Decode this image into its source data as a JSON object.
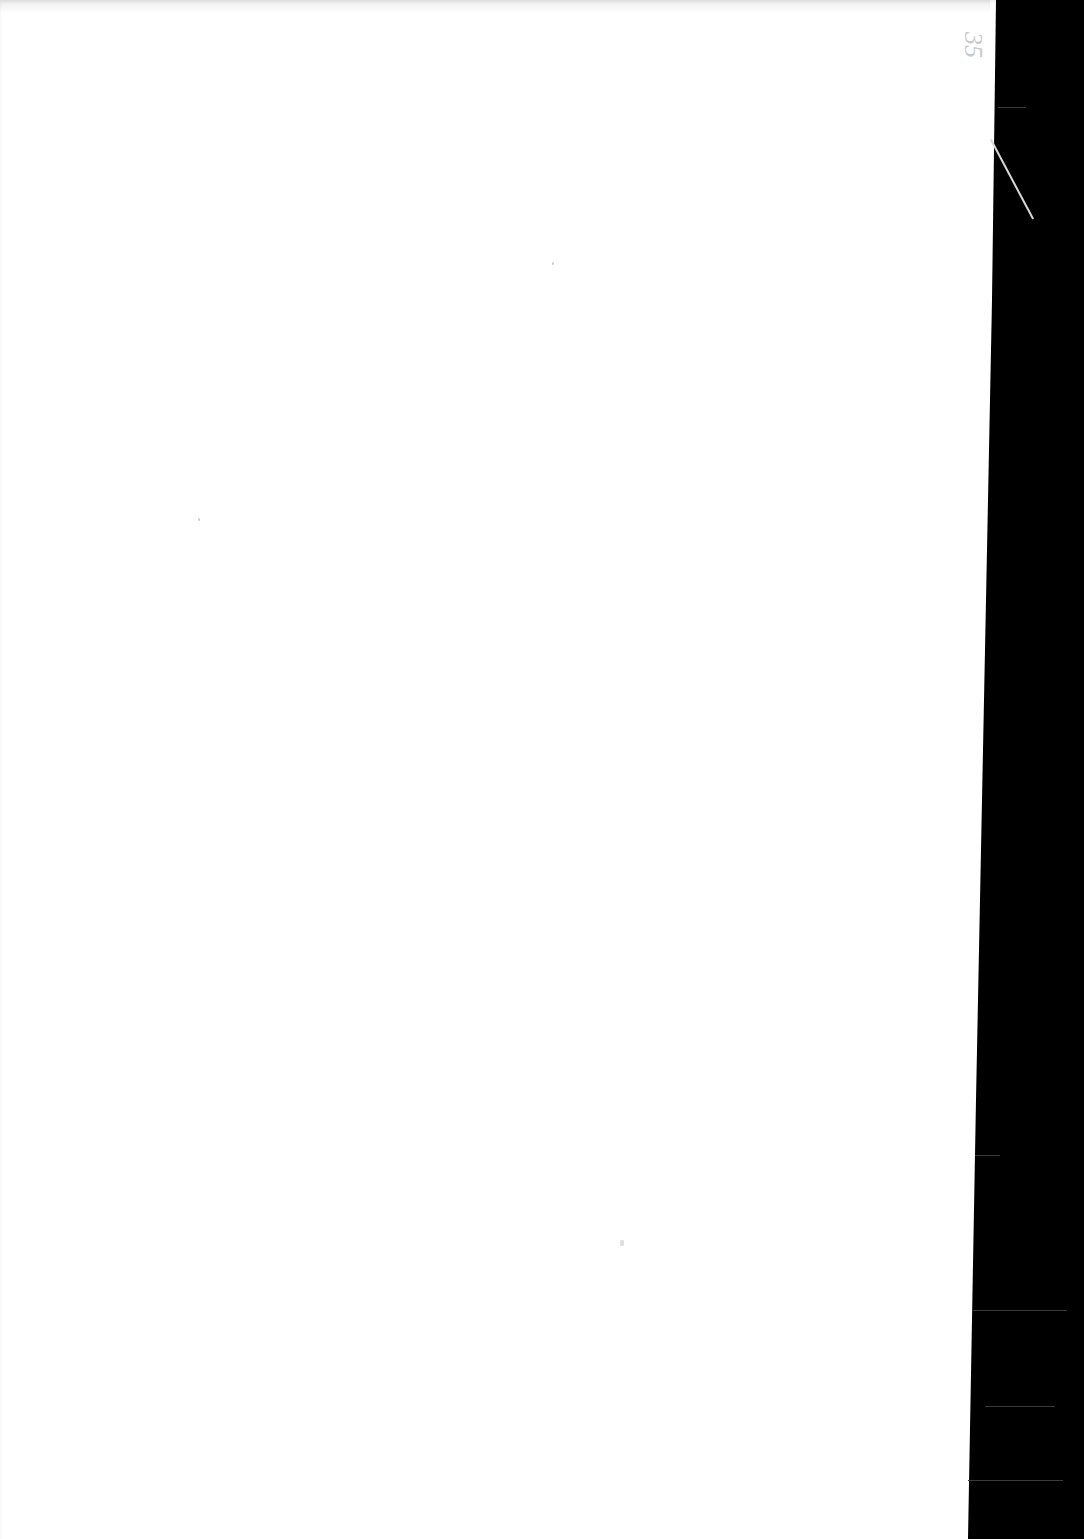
{
  "document": {
    "type": "scanned-blank-page",
    "page_number_mark": "35",
    "faint_bleed_text": "",
    "colors": {
      "paper": "#ffffff",
      "scan_background": "#000000",
      "pencil_mark": "#c9c9c9"
    }
  }
}
